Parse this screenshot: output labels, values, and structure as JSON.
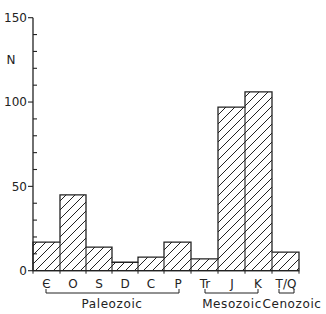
{
  "chart_data": {
    "type": "bar",
    "title": "",
    "xlabel": "",
    "ylabel": "N",
    "ylim": [
      0,
      150
    ],
    "yticks": [
      0,
      50,
      100,
      150
    ],
    "minor_tick_step": 10,
    "grid": false,
    "legend": null,
    "fill": "diagonal hatch",
    "categories": [
      "Є",
      "O",
      "S",
      "D",
      "C",
      "P",
      "Tr",
      "J",
      "K",
      "T/Q"
    ],
    "values": [
      17,
      45,
      14,
      5,
      8,
      17,
      7,
      97,
      106,
      11
    ],
    "groups": [
      {
        "name": "Paleozoic",
        "categories": [
          "Є",
          "O",
          "S",
          "D",
          "C",
          "P"
        ]
      },
      {
        "name": "Mesozoic",
        "categories": [
          "Tr",
          "J",
          "K"
        ]
      },
      {
        "name": "Cenozoic",
        "categories": [
          "T/Q"
        ]
      }
    ]
  },
  "axis": {
    "ylabel": "N",
    "ticks": [
      "0",
      "50",
      "100",
      "150"
    ]
  },
  "labels": [
    "Є",
    "O",
    "S",
    "D",
    "C",
    "P",
    "Tr",
    "J",
    "K",
    "T/Q"
  ],
  "eras": {
    "paleozoic": "Paleozoic",
    "mesozoic": "Mesozoic",
    "cenozoic": "Cenozoic"
  }
}
